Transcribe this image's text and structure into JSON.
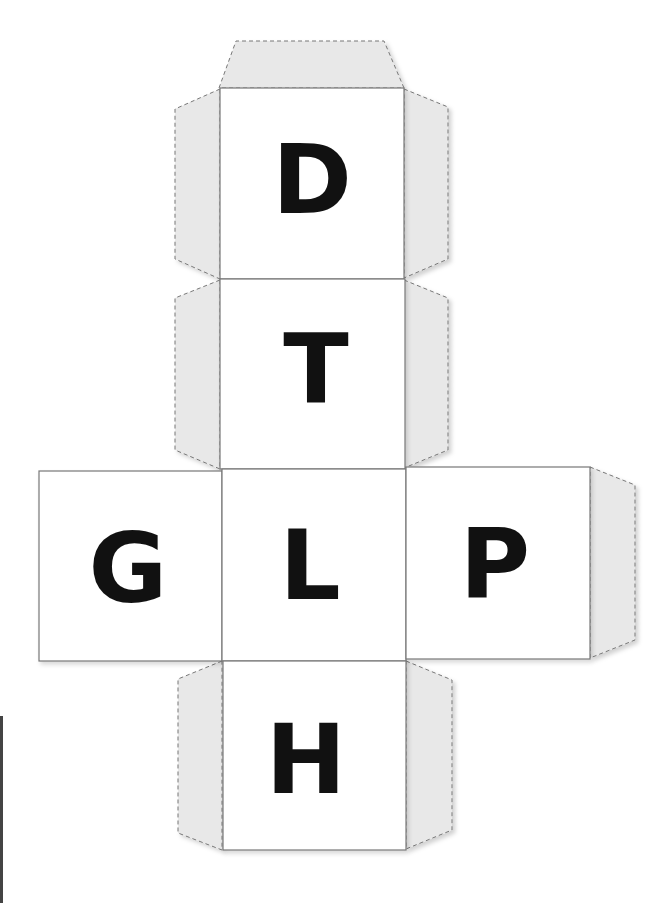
{
  "diagram": {
    "type": "cube-net",
    "faces": [
      {
        "id": "top",
        "letter": "D"
      },
      {
        "id": "upper-middle",
        "letter": "T"
      },
      {
        "id": "left",
        "letter": "G"
      },
      {
        "id": "center",
        "letter": "L"
      },
      {
        "id": "right",
        "letter": "P"
      },
      {
        "id": "bottom",
        "letter": "H"
      }
    ],
    "colors": {
      "tab_fill": "#e8e8e8",
      "line": "#777777",
      "letter": "#111111"
    }
  }
}
